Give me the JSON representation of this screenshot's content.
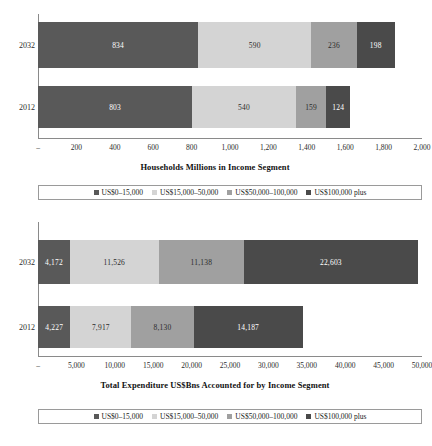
{
  "chart_data": [
    {
      "type": "bar",
      "orientation": "horizontal",
      "stacked": true,
      "title": "Households Millions in Income Segment",
      "xlabel": "",
      "ylabel": "",
      "categories": [
        "2032",
        "2012"
      ],
      "xlim": [
        0,
        2000
      ],
      "xticks": [
        "–",
        "200",
        "400",
        "600",
        "800",
        "1,000",
        "1,200",
        "1,400",
        "1,600",
        "1,800",
        "2,000"
      ],
      "xtick_values": [
        0,
        200,
        400,
        600,
        800,
        1000,
        1200,
        1400,
        1600,
        1800,
        2000
      ],
      "grid": false,
      "legend_position": "below",
      "series": [
        {
          "name": "US$0–15,000",
          "color": "#595959",
          "values": [
            834,
            803
          ],
          "labels": [
            "834",
            "803"
          ]
        },
        {
          "name": "US$15,000–50,000",
          "color": "#d4d4d4",
          "values": [
            590,
            540
          ],
          "labels": [
            "590",
            "540"
          ]
        },
        {
          "name": "US$50,000–100,000",
          "color": "#a0a0a0",
          "values": [
            236,
            159
          ],
          "labels": [
            "236",
            "159"
          ]
        },
        {
          "name": "US$100,000 plus",
          "color": "#4a4a4a",
          "values": [
            198,
            124
          ],
          "labels": [
            "198",
            "124"
          ]
        }
      ]
    },
    {
      "type": "bar",
      "orientation": "horizontal",
      "stacked": true,
      "title": "Total Expenditure US$Bns Accounted for by Income Segment",
      "xlabel": "",
      "ylabel": "",
      "categories": [
        "2032",
        "2012"
      ],
      "xlim": [
        0,
        50000
      ],
      "xticks": [
        "–",
        "5,000",
        "10,000",
        "15,000",
        "20,000",
        "25,000",
        "30,000",
        "35,000",
        "40,000",
        "45,000",
        "50,000"
      ],
      "xtick_values": [
        0,
        5000,
        10000,
        15000,
        20000,
        25000,
        30000,
        35000,
        40000,
        45000,
        50000
      ],
      "grid": false,
      "legend_position": "below",
      "series": [
        {
          "name": "US$0–15,000",
          "color": "#595959",
          "values": [
            4172,
            4227
          ],
          "labels": [
            "4,172",
            "4,227"
          ]
        },
        {
          "name": "US$15,000–50,000",
          "color": "#d4d4d4",
          "values": [
            11526,
            7917
          ],
          "labels": [
            "11,526",
            "7,917"
          ]
        },
        {
          "name": "US$50,000–100,000",
          "color": "#a0a0a0",
          "values": [
            11138,
            8130
          ],
          "labels": [
            "11,138",
            "8,130"
          ]
        },
        {
          "name": "US$100,000 plus",
          "color": "#4a4a4a",
          "values": [
            22603,
            14187
          ],
          "labels": [
            "22,603",
            "14,187"
          ]
        }
      ]
    }
  ],
  "charts": {
    "upper": {
      "title": "Households Millions in Income Segment",
      "categories": [
        "2032",
        "2012"
      ],
      "ticks": [
        "–",
        "200",
        "400",
        "600",
        "800",
        "1,000",
        "1,200",
        "1,400",
        "1,600",
        "1,800",
        "2,000"
      ],
      "rows": [
        {
          "category": "2032",
          "segments": [
            {
              "label": "834",
              "color": "#595959",
              "value": 834,
              "text_on": "dark"
            },
            {
              "label": "590",
              "color": "#d4d4d4",
              "value": 590,
              "text_on": "light"
            },
            {
              "label": "236",
              "color": "#a0a0a0",
              "value": 236,
              "text_on": "light"
            },
            {
              "label": "198",
              "color": "#4a4a4a",
              "value": 198,
              "text_on": "dark"
            }
          ]
        },
        {
          "category": "2012",
          "segments": [
            {
              "label": "803",
              "color": "#595959",
              "value": 803,
              "text_on": "dark"
            },
            {
              "label": "540",
              "color": "#d4d4d4",
              "value": 540,
              "text_on": "light"
            },
            {
              "label": "159",
              "color": "#a0a0a0",
              "value": 159,
              "text_on": "light"
            },
            {
              "label": "124",
              "color": "#4a4a4a",
              "value": 124,
              "text_on": "dark"
            }
          ]
        }
      ]
    },
    "lower": {
      "title": "Total Expenditure US$Bns Accounted for by Income Segment",
      "categories": [
        "2032",
        "2012"
      ],
      "ticks": [
        "–",
        "5,000",
        "10,000",
        "15,000",
        "20,000",
        "25,000",
        "30,000",
        "35,000",
        "40,000",
        "45,000",
        "50,000"
      ],
      "rows": [
        {
          "category": "2032",
          "segments": [
            {
              "label": "4,172",
              "color": "#595959",
              "value": 4172,
              "text_on": "dark"
            },
            {
              "label": "11,526",
              "color": "#d4d4d4",
              "value": 11526,
              "text_on": "light"
            },
            {
              "label": "11,138",
              "color": "#a0a0a0",
              "value": 11138,
              "text_on": "light"
            },
            {
              "label": "22,603",
              "color": "#4a4a4a",
              "value": 22603,
              "text_on": "dark"
            }
          ]
        },
        {
          "category": "2012",
          "segments": [
            {
              "label": "4,227",
              "color": "#595959",
              "value": 4227,
              "text_on": "dark"
            },
            {
              "label": "7,917",
              "color": "#d4d4d4",
              "value": 7917,
              "text_on": "light"
            },
            {
              "label": "8,130",
              "color": "#a0a0a0",
              "value": 8130,
              "text_on": "light"
            },
            {
              "label": "14,187",
              "color": "#4a4a4a",
              "value": 14187,
              "text_on": "dark"
            }
          ]
        }
      ]
    }
  },
  "legend": {
    "items": [
      {
        "label": "US$0–15,000",
        "color": "#595959"
      },
      {
        "label": "US$15,000–50,000",
        "color": "#d4d4d4"
      },
      {
        "label": "US$50,000–100,000",
        "color": "#a0a0a0"
      },
      {
        "label": "US$100,000 plus",
        "color": "#4a4a4a"
      }
    ]
  }
}
